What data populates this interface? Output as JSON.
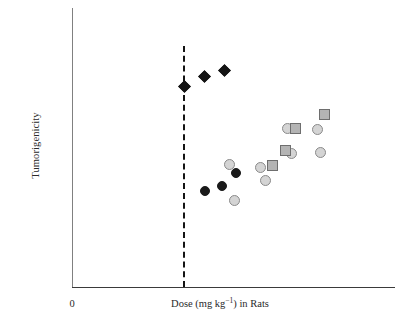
{
  "chart_data": {
    "type": "scatter",
    "title": "",
    "subtitle": "",
    "xlabel_parts": {
      "before": "Dose (mg kg",
      "exponent": "−1",
      "after": ") in Rats"
    },
    "xlabel": "Dose (mg kg⁻¹) in Rats",
    "ylabel": "Tumorigenicity",
    "x_tick_labels": [
      "0"
    ],
    "y_tick_labels": [],
    "grid": false,
    "legend": "none",
    "xlim": [
      0,
      100
    ],
    "ylim": [
      0,
      100
    ],
    "annotations": [
      {
        "name": "threshold-dashed-line",
        "kind": "vertical-dashed-line",
        "x": 34.4,
        "label": ""
      }
    ],
    "series": [
      {
        "name": "black-diamonds",
        "marker": "diamond",
        "fill": "#141414",
        "edge": "#141414",
        "size": 9,
        "points": [
          {
            "x": 34.7,
            "y": 71.7
          },
          {
            "x": 40.9,
            "y": 75.6
          },
          {
            "x": 47.1,
            "y": 77.8
          }
        ]
      },
      {
        "name": "black-circles",
        "marker": "circle",
        "fill": "#1a1a1a",
        "edge": "#1a1a1a",
        "size": 10,
        "points": [
          {
            "x": 41.2,
            "y": 34.4
          },
          {
            "x": 46.4,
            "y": 36.2
          },
          {
            "x": 50.8,
            "y": 41.0
          }
        ]
      },
      {
        "name": "light-gray-circles",
        "marker": "circle",
        "fill": "#d4d4d4",
        "edge": "#8a8a8a",
        "size": 11,
        "points": [
          {
            "x": 48.6,
            "y": 44.2
          },
          {
            "x": 50.2,
            "y": 31.2
          },
          {
            "x": 58.2,
            "y": 43.1
          },
          {
            "x": 59.8,
            "y": 38.3
          },
          {
            "x": 66.6,
            "y": 57.3
          },
          {
            "x": 67.8,
            "y": 48.3
          },
          {
            "x": 75.9,
            "y": 56.9
          },
          {
            "x": 76.8,
            "y": 48.7
          }
        ]
      },
      {
        "name": "gray-squares",
        "marker": "square",
        "fill": "#b4b4b4",
        "edge": "#6e6e6e",
        "size": 11,
        "points": [
          {
            "x": 62.0,
            "y": 43.8
          },
          {
            "x": 66.0,
            "y": 49.6
          },
          {
            "x": 69.0,
            "y": 57.3
          },
          {
            "x": 78.0,
            "y": 62.7
          }
        ]
      }
    ],
    "colors": {
      "axis": "#3a3a3a",
      "axis_y": "#808080",
      "dashed_line": "#141414",
      "diamond_fill": "#141414",
      "black_circle_fill": "#1a1a1a",
      "gray_circle_fill": "#d4d4d4",
      "gray_circle_edge": "#8a8a8a",
      "square_fill": "#b4b4b4",
      "square_edge": "#6e6e6e",
      "background": "#ffffff",
      "text": "#2a2a2a"
    }
  },
  "pixel_markers": [
    {
      "series": "black-diamonds",
      "cx": 184,
      "cy": 86,
      "size": 9,
      "shape": "diamond"
    },
    {
      "series": "black-diamonds",
      "cx": 204,
      "cy": 76,
      "size": 9,
      "shape": "diamond"
    },
    {
      "series": "black-diamonds",
      "cx": 224,
      "cy": 70,
      "size": 9,
      "shape": "diamond"
    },
    {
      "series": "black-circles",
      "cx": 205,
      "cy": 191,
      "size": 10,
      "shape": "circle"
    },
    {
      "series": "black-circles",
      "cx": 222,
      "cy": 186,
      "size": 10,
      "shape": "circle"
    },
    {
      "series": "black-circles",
      "cx": 236,
      "cy": 173,
      "size": 10,
      "shape": "circle"
    },
    {
      "series": "light-gray-circles",
      "cx": 229,
      "cy": 164,
      "size": 11,
      "shape": "circle"
    },
    {
      "series": "light-gray-circles",
      "cx": 234,
      "cy": 200,
      "size": 11,
      "shape": "circle"
    },
    {
      "series": "light-gray-circles",
      "cx": 260,
      "cy": 167,
      "size": 11,
      "shape": "circle"
    },
    {
      "series": "light-gray-circles",
      "cx": 265,
      "cy": 180,
      "size": 11,
      "shape": "circle"
    },
    {
      "series": "light-gray-circles",
      "cx": 287,
      "cy": 128,
      "size": 11,
      "shape": "circle"
    },
    {
      "series": "light-gray-circles",
      "cx": 291,
      "cy": 153,
      "size": 11,
      "shape": "circle"
    },
    {
      "series": "light-gray-circles",
      "cx": 317,
      "cy": 129,
      "size": 11,
      "shape": "circle"
    },
    {
      "series": "light-gray-circles",
      "cx": 320,
      "cy": 152,
      "size": 11,
      "shape": "circle"
    },
    {
      "series": "gray-squares",
      "cx": 272,
      "cy": 165,
      "size": 11,
      "shape": "square"
    },
    {
      "series": "gray-squares",
      "cx": 285,
      "cy": 150,
      "size": 11,
      "shape": "square"
    },
    {
      "series": "gray-squares",
      "cx": 295,
      "cy": 128,
      "size": 11,
      "shape": "square"
    },
    {
      "series": "gray-squares",
      "cx": 324,
      "cy": 114,
      "size": 11,
      "shape": "square"
    }
  ]
}
